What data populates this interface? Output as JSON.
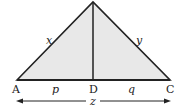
{
  "diagram": {
    "fill_color": "#e8e8e8",
    "stroke_color": "#222222",
    "vertices": {
      "A": "A",
      "D": "D",
      "C": "C"
    },
    "sides": {
      "left": "x",
      "right": "y"
    },
    "segments": {
      "AD": "p",
      "DC": "q"
    },
    "base_length": "z"
  }
}
